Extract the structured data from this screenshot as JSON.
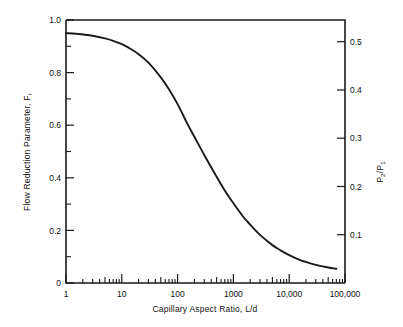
{
  "chart_data": {
    "type": "line",
    "title": "",
    "xlabel": "Capillary Aspect Ratio, L/d",
    "ylabel": "Flow Reduction Parameter, F",
    "ylabel_subscript": "r",
    "y2label_num": "P",
    "y2label_num_sub": "2",
    "y2label_den": "P",
    "y2label_den_sub": "1",
    "xscale": "log",
    "xlim": [
      1,
      100000
    ],
    "ylim": [
      0,
      1.0
    ],
    "y2lim": [
      0,
      0.545
    ],
    "grid": false,
    "legend": null,
    "xticks": [
      1,
      10,
      100,
      1000,
      10000,
      100000
    ],
    "xtick_labels": [
      "1",
      "10",
      "100",
      "1000",
      "10,000",
      "100,000"
    ],
    "yticks": [
      0,
      0.2,
      0.4,
      0.6,
      0.8,
      1.0
    ],
    "ytick_labels": [
      "0",
      "0.2",
      "0.4",
      "0.6",
      "0.8",
      "1.0"
    ],
    "yticks_minor": [
      0.1,
      0.3,
      0.5,
      0.7,
      0.9
    ],
    "y2ticks": [
      0.1,
      0.2,
      0.3,
      0.4,
      0.5
    ],
    "y2tick_labels": [
      "0.1",
      "0.2",
      "0.3",
      "0.4",
      "0.5"
    ],
    "series": [
      {
        "name": "Flow Reduction Parameter",
        "x": [
          1,
          1.5,
          2,
          3,
          5,
          7,
          10,
          15,
          20,
          30,
          50,
          70,
          100,
          150,
          200,
          300,
          500,
          700,
          1000,
          1500,
          2000,
          3000,
          5000,
          7000,
          10000,
          15000,
          20000,
          30000,
          50000,
          70000
        ],
        "values": [
          0.95,
          0.948,
          0.945,
          0.94,
          0.93,
          0.921,
          0.908,
          0.888,
          0.87,
          0.838,
          0.782,
          0.737,
          0.68,
          0.605,
          0.556,
          0.487,
          0.404,
          0.352,
          0.303,
          0.252,
          0.222,
          0.183,
          0.144,
          0.124,
          0.106,
          0.089,
          0.08,
          0.069,
          0.059,
          0.054
        ]
      }
    ]
  }
}
